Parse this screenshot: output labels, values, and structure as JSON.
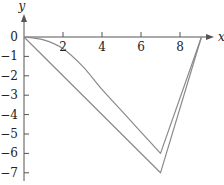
{
  "chart_data": {
    "type": "line",
    "title": "",
    "xlabel": "x",
    "ylabel": "y",
    "xlim": [
      0,
      9.5
    ],
    "ylim": [
      -7.5,
      1.5
    ],
    "x_ticks": [
      2,
      4,
      6,
      8
    ],
    "y_ticks": [
      0,
      -1,
      -2,
      -3,
      -4,
      -5,
      -6,
      -7
    ],
    "x_tick_labels": [
      "2",
      "4",
      "6",
      "8"
    ],
    "y_tick_labels": [
      "0",
      "−1",
      "−2",
      "−3",
      "−4",
      "−5",
      "−6",
      "−7"
    ],
    "grid": false,
    "legend": null,
    "series": [
      {
        "name": "upper curve",
        "color": "#8a8a8a",
        "x": [
          0,
          1,
          2,
          3,
          4,
          5,
          6,
          7,
          9.1
        ],
        "y": [
          0,
          -0.15,
          -0.6,
          -1.5,
          -2.7,
          -3.8,
          -4.9,
          -6,
          0
        ]
      },
      {
        "name": "lower curve",
        "color": "#8a8a8a",
        "x": [
          0,
          7,
          9.1
        ],
        "y": [
          0,
          -7,
          0
        ]
      }
    ]
  },
  "style": {
    "axis_color": "#555555",
    "line_color": "#8a8a8a"
  }
}
